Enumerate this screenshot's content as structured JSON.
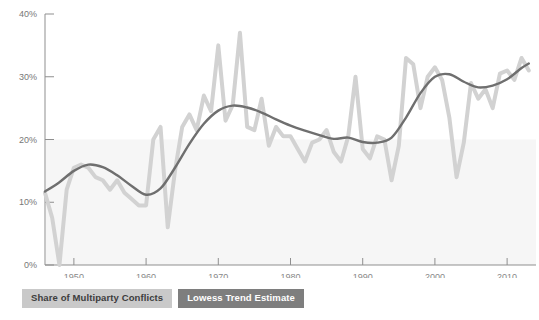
{
  "chart_data": {
    "type": "line",
    "title": "",
    "subtitle": "",
    "xlabel": "",
    "ylabel": "",
    "xlim": [
      1946,
      2014
    ],
    "ylim": [
      0,
      40
    ],
    "grid": false,
    "y_tick_labels": [
      "0%",
      "10%",
      "20%",
      "30%",
      "40%"
    ],
    "y_tick_values": [
      0,
      10,
      20,
      30,
      40
    ],
    "x_tick_labels": [
      "1950",
      "1960",
      "1970",
      "1980",
      "1990",
      "2000",
      "2010"
    ],
    "x_tick_values": [
      1950,
      1960,
      1970,
      1980,
      1990,
      2000,
      2010
    ],
    "shaded_band": {
      "from": 0,
      "to": 20,
      "color": "#f6f6f6"
    },
    "legend_position": "below-left",
    "series": [
      {
        "name": "Share of Multiparty Conflicts",
        "color": "#d2d2d2",
        "width": 4,
        "x": [
          1946,
          1947,
          1948,
          1949,
          1950,
          1951,
          1952,
          1953,
          1954,
          1955,
          1956,
          1957,
          1958,
          1959,
          1960,
          1961,
          1962,
          1963,
          1964,
          1965,
          1966,
          1967,
          1968,
          1969,
          1970,
          1971,
          1972,
          1973,
          1974,
          1975,
          1976,
          1977,
          1978,
          1979,
          1980,
          1981,
          1982,
          1983,
          1984,
          1985,
          1986,
          1987,
          1988,
          1989,
          1990,
          1991,
          1992,
          1993,
          1994,
          1995,
          1996,
          1997,
          1998,
          1999,
          2000,
          2001,
          2002,
          2003,
          2004,
          2005,
          2006,
          2007,
          2008,
          2009,
          2010,
          2011,
          2012,
          2013
        ],
        "values": [
          11.5,
          7.5,
          0.0,
          12.0,
          15.5,
          16.0,
          15.5,
          14.0,
          13.5,
          12.0,
          13.5,
          11.5,
          10.5,
          9.5,
          9.5,
          20.0,
          22.0,
          6.0,
          15.0,
          22.0,
          24.0,
          21.5,
          27.0,
          24.5,
          35.0,
          23.0,
          25.5,
          37.0,
          22.0,
          21.5,
          26.5,
          19.0,
          22.0,
          20.5,
          20.5,
          18.5,
          16.5,
          19.5,
          20.0,
          21.5,
          18.0,
          16.5,
          20.5,
          30.0,
          18.5,
          17.0,
          20.5,
          20.0,
          13.5,
          19.0,
          33.0,
          32.0,
          25.0,
          30.0,
          31.5,
          29.5,
          23.5,
          14.0,
          19.5,
          29.0,
          26.5,
          28.0,
          25.0,
          30.5,
          31.0,
          29.5,
          33.0,
          31.0
        ]
      },
      {
        "name": "Lowess Trend Estimate",
        "color": "#6f6f6f",
        "width": 2.4,
        "x": [
          1946,
          1948,
          1950,
          1952,
          1954,
          1956,
          1958,
          1960,
          1962,
          1964,
          1966,
          1968,
          1970,
          1972,
          1974,
          1976,
          1978,
          1980,
          1982,
          1984,
          1986,
          1988,
          1990,
          1992,
          1994,
          1996,
          1998,
          2000,
          2002,
          2004,
          2006,
          2008,
          2010,
          2012,
          2013
        ],
        "values": [
          11.7,
          13.2,
          15.0,
          16.0,
          15.6,
          14.3,
          12.6,
          11.2,
          12.2,
          15.5,
          19.3,
          22.5,
          24.6,
          25.4,
          25.1,
          24.3,
          23.2,
          22.2,
          21.4,
          20.7,
          20.1,
          20.3,
          19.6,
          19.5,
          20.3,
          23.5,
          27.4,
          30.0,
          30.4,
          29.2,
          28.3,
          28.6,
          29.6,
          31.4,
          32.1
        ]
      }
    ]
  },
  "legend": {
    "items": [
      {
        "label": "Share of Multiparty Conflicts",
        "style": "light"
      },
      {
        "label": "Lowess Trend Estimate",
        "style": "dark"
      }
    ]
  },
  "colors": {
    "series_raw": "#d2d2d2",
    "series_trend": "#6f6f6f",
    "axis": "#8f8f8f",
    "band": "#f6f6f6",
    "legend_light_bg": "#c9c9c9",
    "legend_dark_bg": "#7e7e7e"
  }
}
